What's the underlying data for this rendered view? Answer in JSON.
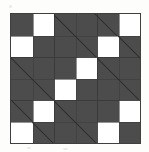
{
  "image": {
    "title": "Patchwork quilt block",
    "description": "Square pieced quilt block photographed on white background",
    "background_color": "#fdfdfb"
  },
  "block": {
    "name": "quilt-block",
    "shape": "square",
    "grid_columns": 6,
    "grid_rows": 6,
    "unit_count": 36,
    "colors": {
      "dark_fabric": "#4c4c4c",
      "light_fabric": "#ffffff",
      "seam_line": "#3a3a3a",
      "border": "#3f3f3f"
    },
    "units": [
      {
        "name": "top-left-checker",
        "type": "four-patch",
        "position": "top-left"
      },
      {
        "name": "top-center-triangle",
        "type": "half-square-triangle",
        "position": "top-center",
        "diagonal": "tl-br"
      },
      {
        "name": "top-right-checker",
        "type": "four-patch",
        "position": "top-right"
      },
      {
        "name": "middle-left-triangle",
        "type": "half-square-triangle",
        "position": "middle-left",
        "diagonal": "tl-br"
      },
      {
        "name": "center-checker",
        "type": "four-patch",
        "position": "center"
      },
      {
        "name": "middle-right-triangle",
        "type": "half-square-triangle",
        "position": "middle-right",
        "diagonal": "tl-br"
      },
      {
        "name": "bottom-left-checker",
        "type": "four-patch",
        "position": "bottom-left"
      },
      {
        "name": "bottom-center-triangle",
        "type": "half-square-triangle",
        "position": "bottom-center",
        "diagonal": "tl-br"
      },
      {
        "name": "bottom-right-checker",
        "type": "four-patch",
        "position": "bottom-right"
      }
    ],
    "cells": [
      [
        "dark",
        "light",
        "dark",
        "dark",
        "dark",
        "light"
      ],
      [
        "light",
        "dark",
        "dark",
        "dark",
        "light",
        "dark"
      ],
      [
        "dark",
        "dark",
        "dark",
        "light",
        "dark",
        "dark"
      ],
      [
        "dark",
        "dark",
        "light",
        "dark",
        "dark",
        "dark"
      ],
      [
        "dark",
        "light",
        "dark",
        "dark",
        "dark",
        "light"
      ],
      [
        "light",
        "dark",
        "dark",
        "dark",
        "light",
        "dark"
      ]
    ]
  }
}
